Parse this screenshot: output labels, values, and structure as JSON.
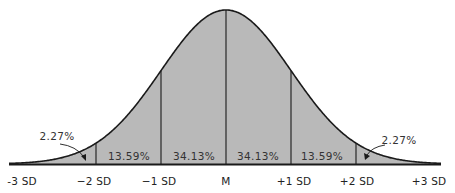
{
  "diagram": {
    "colors": {
      "fill": "#b9b9b9",
      "stroke": "#1a1a1a",
      "background": "#ffffff"
    },
    "axis_labels": [
      {
        "id": "minus3",
        "label": "-3 SD"
      },
      {
        "id": "minus2",
        "label": "−2 SD"
      },
      {
        "id": "minus1",
        "label": "−1 SD"
      },
      {
        "id": "mean",
        "label": "M"
      },
      {
        "id": "plus1",
        "label": "+1 SD"
      },
      {
        "id": "plus2",
        "label": "+2 SD"
      },
      {
        "id": "plus3",
        "label": "+3 SD"
      }
    ],
    "regions": [
      {
        "id": "left-tail",
        "label": "2.27%"
      },
      {
        "id": "minus2-minus1",
        "label": "13.59%"
      },
      {
        "id": "minus1-mean",
        "label": "34.13%"
      },
      {
        "id": "mean-plus1",
        "label": "34.13%"
      },
      {
        "id": "plus1-plus2",
        "label": "13.59%"
      },
      {
        "id": "right-tail",
        "label": "2.27%"
      }
    ]
  }
}
